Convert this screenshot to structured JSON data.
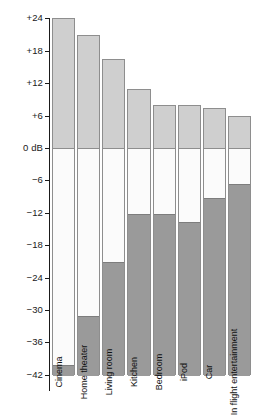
{
  "chart_data": {
    "type": "bar",
    "title": "",
    "subtitle": "",
    "xlabel": "",
    "ylabel": "dB",
    "ylim": [
      -42,
      24
    ],
    "grid": false,
    "legend": "none",
    "categories": [
      "Cinema",
      "Home theater",
      "Living room",
      "Kitchen",
      "Bedroom",
      "iPod",
      "Car",
      "In flight entertainment"
    ],
    "yticks": [
      24,
      18,
      12,
      6,
      0,
      -6,
      -12,
      -18,
      -24,
      -30,
      -36,
      -42
    ],
    "ytick_labels": [
      "+24",
      "+18",
      "+12",
      "+6",
      "0 dB",
      "−6",
      "−12",
      "−18",
      "−24",
      "−30",
      "−36",
      "−42"
    ],
    "series": [
      {
        "name": "Headroom above 0 dB",
        "color": "#cfcfcf",
        "values": [
          24,
          21,
          16.5,
          11,
          8,
          8,
          7.5,
          6
        ]
      },
      {
        "name": "Usable dynamic range",
        "color": "#fbfbfb",
        "values": [
          40,
          31,
          21,
          12,
          12,
          13.5,
          9,
          6.5
        ]
      },
      {
        "name": "Noise floor below",
        "color": "#9a9a9a",
        "values": [
          -42,
          -42,
          -42,
          -42,
          -42,
          -42,
          -42,
          -42
        ]
      }
    ],
    "bars": [
      {
        "label": "Cinema",
        "top": 24,
        "noise_top": -40,
        "bottom": -42
      },
      {
        "label": "Home theater",
        "top": 21,
        "noise_top": -31,
        "bottom": -42
      },
      {
        "label": "Living room",
        "top": 16.5,
        "noise_top": -21,
        "bottom": -42
      },
      {
        "label": "Kitchen",
        "top": 11,
        "noise_top": -12,
        "bottom": -42
      },
      {
        "label": "Bedroom",
        "top": 8,
        "noise_top": -12,
        "bottom": -42
      },
      {
        "label": "iPod",
        "top": 8,
        "noise_top": -13.5,
        "bottom": -42
      },
      {
        "label": "Car",
        "top": 7.5,
        "noise_top": -9,
        "bottom": -42
      },
      {
        "label": "In flight entertainment",
        "top": 6,
        "noise_top": -6.5,
        "bottom": -42
      }
    ],
    "colors": {
      "headroom": "#cfcfcf",
      "range": "#fbfbfb",
      "noise": "#9a9a9a",
      "outline": "#8e8e8e",
      "axis": "#1a1a1a"
    }
  }
}
